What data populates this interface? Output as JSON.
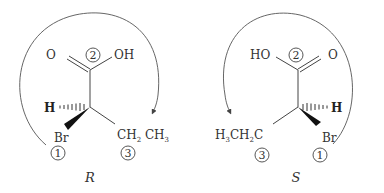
{
  "diagram": {
    "left": {
      "configuration": "R",
      "carbonyl_O": "O",
      "hydroxyl": "OH",
      "hydrogen": "H",
      "bromine": "Br",
      "ethyl_main": "CH",
      "ethyl_sub1": "2",
      "ethyl_mid": " CH",
      "ethyl_sub2": "3",
      "priority_1": "1",
      "priority_2": "2",
      "priority_3": "3"
    },
    "right": {
      "configuration": "S",
      "carbonyl_O": "O",
      "hydroxyl": "HO",
      "hydrogen": "H",
      "bromine": "Br",
      "ethyl_a": "H",
      "ethyl_sub1": "3",
      "ethyl_b": "CH",
      "ethyl_sub2": "2",
      "ethyl_c": "C",
      "priority_1": "1",
      "priority_2": "2",
      "priority_3": "3"
    },
    "colors": {
      "stroke": "#444444",
      "text": "#333333",
      "background": "#ffffff"
    }
  }
}
